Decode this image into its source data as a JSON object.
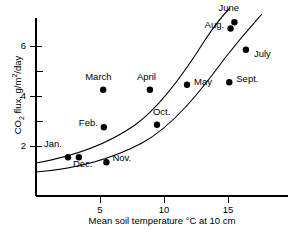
{
  "chart_data": {
    "type": "scatter",
    "title": "",
    "xlabel": "Mean soil temperature °C at 10 cm",
    "ylabel": "CO2 flux, g/m2/day",
    "ylabel_parts": {
      "prefix": "CO",
      "sub": "2",
      "mid": " flux, g/m",
      "sup": "2",
      "suffix": "/day"
    },
    "xlim": [
      0,
      19.7
    ],
    "ylim": [
      0,
      7.4
    ],
    "grid": false,
    "legend": "none",
    "xticks": [
      5,
      10,
      15
    ],
    "xtick_labels": [
      "5",
      "10",
      "15"
    ],
    "yticks": [
      2,
      4,
      6
    ],
    "ytick_labels": [
      "2",
      "4",
      "6"
    ],
    "minor_yticks": [
      3,
      5
    ],
    "points": [
      {
        "label": "Jan.",
        "x": 2.5,
        "y": 1.55,
        "label_dx": -24,
        "label_dy": -13
      },
      {
        "label": "Dec.",
        "x": 3.35,
        "y": 1.55,
        "label_dx": -6,
        "label_dy": 7
      },
      {
        "label": "Nov.",
        "x": 5.5,
        "y": 1.35,
        "label_dx": 6,
        "label_dy": -4
      },
      {
        "label": "Feb.",
        "x": 5.3,
        "y": 2.75,
        "label_dx": -25,
        "label_dy": -4
      },
      {
        "label": "March",
        "x": 5.25,
        "y": 4.25,
        "label_dx": -18,
        "label_dy": -13
      },
      {
        "label": "April",
        "x": 8.9,
        "y": 4.25,
        "label_dx": -13,
        "label_dy": -13
      },
      {
        "label": "Oct.",
        "x": 9.45,
        "y": 2.85,
        "label_dx": -4,
        "label_dy": -13
      },
      {
        "label": "May",
        "x": 11.8,
        "y": 4.45,
        "label_dx": 7,
        "label_dy": -3
      },
      {
        "label": "Sept.",
        "x": 15.1,
        "y": 4.55,
        "label_dx": 7,
        "label_dy": -3
      },
      {
        "label": "Aug.",
        "x": 15.2,
        "y": 6.7,
        "label_dx": -26,
        "label_dy": -4
      },
      {
        "label": "June",
        "x": 15.5,
        "y": 6.95,
        "label_dx": -16,
        "label_dy": -14
      },
      {
        "label": "July",
        "x": 16.4,
        "y": 5.85,
        "label_dx": 8,
        "label_dy": 4
      }
    ],
    "curves": [
      {
        "name": "upper-fit-curve",
        "path": "M 36,163 C 70,157 105,146 135,125 C 160,107 185,72 205,40 C 215,25 224,14 230,8"
      },
      {
        "name": "lower-fit-curve",
        "path": "M 36,172 C 75,169 110,160 142,143 C 172,127 200,92 225,58 C 243,35 255,22 262,14"
      }
    ]
  }
}
